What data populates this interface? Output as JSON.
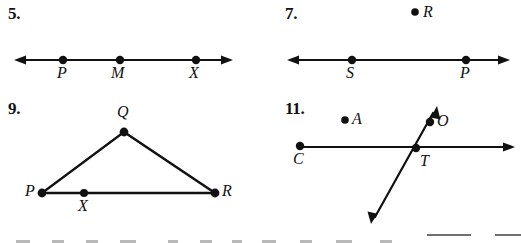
{
  "page": {
    "type": "geometry-worksheet-scan",
    "background": "#ffffff",
    "ink": "#111111"
  },
  "problems": [
    {
      "number": "5.",
      "figure": "line-with-three-points",
      "points": [
        {
          "label": "P",
          "x": 63,
          "y": 60
        },
        {
          "label": "M",
          "x": 120,
          "y": 60
        },
        {
          "label": "X",
          "x": 196,
          "y": 60
        }
      ],
      "line": {
        "x1": 14,
        "x2": 233,
        "y": 60,
        "arrows": "both"
      }
    },
    {
      "number": "7.",
      "figure": "line-with-two-points-and-isolated-point",
      "points": [
        {
          "label": "S",
          "x": 352,
          "y": 60
        },
        {
          "label": "P",
          "x": 466,
          "y": 60
        }
      ],
      "isolated_points": [
        {
          "label": "R",
          "x": 415,
          "y": 12
        }
      ],
      "line": {
        "x1": 287,
        "x2": 510,
        "y": 60,
        "arrows": "both"
      }
    },
    {
      "number": "9.",
      "figure": "triangle-with-point-on-base",
      "points": [
        {
          "label": "Q",
          "x": 124,
          "y": 132
        },
        {
          "label": "P",
          "x": 42,
          "y": 193
        },
        {
          "label": "R",
          "x": 215,
          "y": 193
        },
        {
          "label": "X",
          "x": 84,
          "y": 193
        }
      ],
      "segments": [
        {
          "from": "P",
          "to": "Q"
        },
        {
          "from": "Q",
          "to": "R"
        },
        {
          "from": "P",
          "to": "R"
        }
      ]
    },
    {
      "number": "11.",
      "figure": "two-intersecting-lines-with-isolated-point",
      "points": [
        {
          "label": "C",
          "x": 300,
          "y": 146
        },
        {
          "label": "T",
          "x": 416,
          "y": 148
        },
        {
          "label": "O",
          "x": 430,
          "y": 122
        }
      ],
      "isolated_points": [
        {
          "label": "A",
          "x": 345,
          "y": 120
        }
      ],
      "horizontal_line": {
        "x1": 300,
        "x2": 515,
        "y": 147,
        "arrows": "right"
      },
      "diagonal_line": {
        "x1": 437,
        "y1": 106,
        "x2": 371,
        "y2": 224,
        "arrows": "both"
      }
    }
  ],
  "cut_off_row": {
    "description": "top edge of next problem row, clipped by page bottom",
    "overline_bars": [
      {
        "x": 427,
        "width": 44
      },
      {
        "x": 495,
        "width": 26
      }
    ],
    "glyph_tops": [
      {
        "x": 16,
        "width": 14
      },
      {
        "x": 52,
        "width": 12
      },
      {
        "x": 86,
        "width": 12
      },
      {
        "x": 120,
        "width": 16
      },
      {
        "x": 168,
        "width": 10
      },
      {
        "x": 200,
        "width": 12
      },
      {
        "x": 232,
        "width": 10
      },
      {
        "x": 262,
        "width": 14
      },
      {
        "x": 300,
        "width": 12
      },
      {
        "x": 336,
        "width": 16
      },
      {
        "x": 380,
        "width": 12
      }
    ]
  }
}
